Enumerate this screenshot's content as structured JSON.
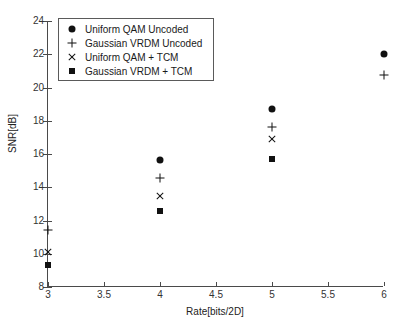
{
  "chart_data": {
    "type": "scatter",
    "title": "",
    "xlabel": "Rate[bits/2D]",
    "ylabel": "SNR[dB]",
    "xlim": [
      3,
      6
    ],
    "ylim": [
      8,
      24
    ],
    "xticks": [
      "3",
      "3.5",
      "4",
      "4.5",
      "5",
      "5.5",
      "6"
    ],
    "xtick_values": [
      3,
      3.5,
      4,
      4.5,
      5,
      5.5,
      6
    ],
    "yticks": [
      "8",
      "10",
      "12",
      "14",
      "16",
      "18",
      "20",
      "22",
      "24"
    ],
    "ytick_values": [
      8,
      10,
      12,
      14,
      16,
      18,
      20,
      22,
      24
    ],
    "grid": false,
    "legend_position": "upper left",
    "marker_color": "#111111",
    "series": [
      {
        "name": "Uniform QAM Uncoded",
        "marker": "circle",
        "x": [
          4,
          5,
          6
        ],
        "y": [
          15.65,
          18.7,
          22.0
        ]
      },
      {
        "name": "Gaussian VRDM Uncoded",
        "marker": "plus",
        "x": [
          3,
          4,
          5,
          6
        ],
        "y": [
          11.4,
          14.55,
          17.65,
          20.75
        ]
      },
      {
        "name": "Uniform QAM + TCM",
        "marker": "cross",
        "x": [
          3,
          4,
          5
        ],
        "y": [
          10.1,
          13.5,
          16.9
        ]
      },
      {
        "name": "Gaussian VRDM + TCM",
        "marker": "square",
        "x": [
          3,
          4,
          5
        ],
        "y": [
          9.3,
          12.55,
          15.7
        ]
      }
    ]
  },
  "legend": {
    "items": [
      {
        "label": "Uniform QAM Uncoded",
        "marker": "circle"
      },
      {
        "label": "Gaussian VRDM Uncoded",
        "marker": "plus"
      },
      {
        "label": "Uniform QAM + TCM",
        "marker": "cross"
      },
      {
        "label": "Gaussian VRDM + TCM",
        "marker": "square"
      }
    ]
  }
}
